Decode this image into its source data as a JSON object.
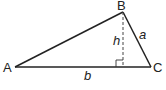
{
  "diagram": {
    "type": "triangle-with-altitude",
    "colors": {
      "stroke": "#222222",
      "dashed": "#444444",
      "background": "#ffffff"
    },
    "vertices": {
      "A": {
        "label": "A",
        "x": 15,
        "y": 67
      },
      "B": {
        "label": "B",
        "x": 123,
        "y": 12
      },
      "C": {
        "label": "C",
        "x": 151,
        "y": 67
      }
    },
    "sides": {
      "a": {
        "label": "a",
        "between": "B-C"
      },
      "b": {
        "label": "b",
        "between": "A-C"
      }
    },
    "altitude": {
      "label": "h",
      "from": "B",
      "foot": {
        "x": 123,
        "y": 67
      },
      "style": "dashed",
      "right_angle_marker": true
    }
  }
}
